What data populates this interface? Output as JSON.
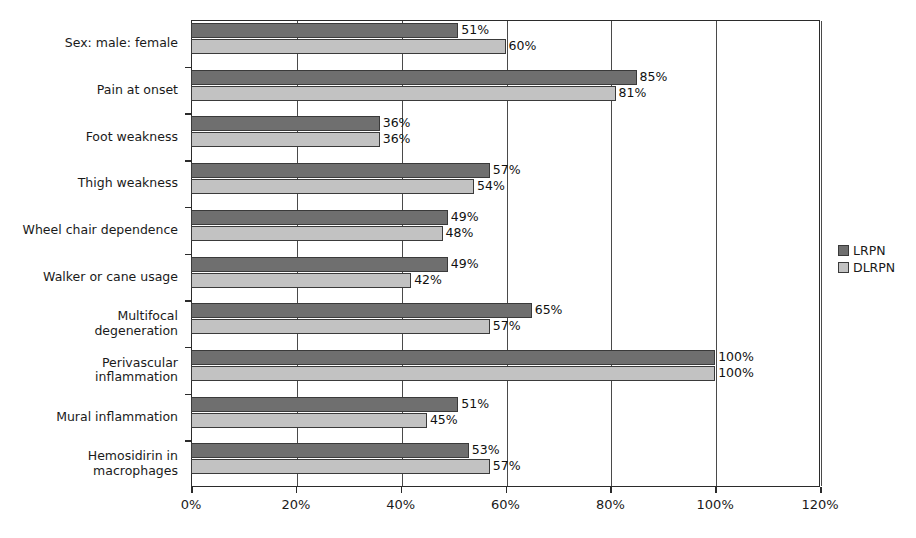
{
  "chart_data": {
    "type": "bar",
    "orientation": "horizontal",
    "title": "",
    "xlabel": "",
    "ylabel": "",
    "xlim": [
      0,
      120
    ],
    "xticks": [
      "0%",
      "20%",
      "40%",
      "60%",
      "80%",
      "100%",
      "120%"
    ],
    "xtick_values": [
      0,
      20,
      40,
      60,
      80,
      100,
      120
    ],
    "grid": "vertical",
    "legend_position": "right",
    "value_suffix": "%",
    "categories": [
      "Sex: male: female",
      "Pain at onset",
      "Foot weakness",
      "Thigh weakness",
      "Wheel chair dependence",
      "Walker or cane usage",
      "Multifocal\ndegeneration",
      "Perivascular\ninflammation",
      "Mural inflammation",
      "Hemosidirin in\nmacrophages"
    ],
    "series": [
      {
        "name": "LRPN",
        "color": "#6f6f6f",
        "values": [
          51,
          85,
          36,
          57,
          49,
          49,
          65,
          100,
          51,
          53
        ],
        "labels": [
          "51%",
          "85%",
          "36%",
          "57%",
          "49%",
          "49%",
          "65%",
          "100%",
          "51%",
          "53%"
        ]
      },
      {
        "name": "DLRPN",
        "color": "#c2c2c2",
        "values": [
          60,
          81,
          36,
          54,
          48,
          42,
          57,
          100,
          45,
          57
        ],
        "labels": [
          "60%",
          "81%",
          "36%",
          "54%",
          "48%",
          "42%",
          "57%",
          "100%",
          "45%",
          "57%"
        ]
      }
    ]
  },
  "legend": {
    "items": [
      {
        "label": "LRPN",
        "color": "#6f6f6f"
      },
      {
        "label": "DLRPN",
        "color": "#c2c2c2"
      }
    ]
  },
  "colors": {
    "series_lrpn": "#6f6f6f",
    "series_dlrpn": "#c2c2c2",
    "axis": "#2b2b2b",
    "grid": "#4a4a4a",
    "background": "#ffffff",
    "text": "#1a1a1a"
  }
}
